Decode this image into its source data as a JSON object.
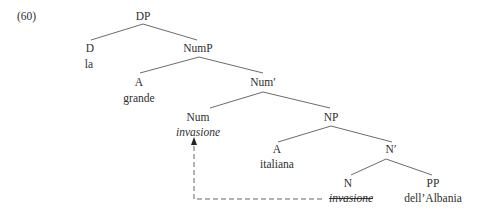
{
  "example_number": "(60)",
  "tree": {
    "nodes": [
      {
        "id": "dp",
        "label": "DP",
        "word": null,
        "x": 143,
        "y": 9
      },
      {
        "id": "d",
        "label": "D",
        "word": "la",
        "x": 90,
        "y": 41
      },
      {
        "id": "nump",
        "label": "NumP",
        "word": null,
        "x": 198,
        "y": 41
      },
      {
        "id": "a1",
        "label": "A",
        "word": "grande",
        "x": 139,
        "y": 75
      },
      {
        "id": "numbar",
        "label": "Num′",
        "word": null,
        "x": 263,
        "y": 75
      },
      {
        "id": "num",
        "label": "Num",
        "word": "invasione",
        "x": 198,
        "y": 110
      },
      {
        "id": "np",
        "label": "NP",
        "word": null,
        "x": 331,
        "y": 110
      },
      {
        "id": "a2",
        "label": "A",
        "word": "italiana",
        "x": 277,
        "y": 142
      },
      {
        "id": "nbar",
        "label": "N′",
        "word": null,
        "x": 390,
        "y": 142
      },
      {
        "id": "n",
        "label": "N",
        "word": "invasione",
        "x": 349,
        "y": 176
      },
      {
        "id": "pp",
        "label": "PP",
        "word": "dell’Albania",
        "x": 433,
        "y": 176
      }
    ],
    "labels": {
      "dp": "DP",
      "d": "D",
      "d_word": "la",
      "nump": "NumP",
      "a1": "A",
      "a1_word": "grande",
      "numbar": "Num′",
      "num": "Num",
      "num_word": "invasione",
      "np": "NP",
      "a2": "A",
      "a2_word": "italiana",
      "nbar": "N′",
      "n": "N",
      "n_word_trace": "invasione",
      "pp": "PP",
      "pp_word": "dell’Albania"
    },
    "edges": [
      {
        "from": "DP",
        "to": "D",
        "x1": 143,
        "y1": 24,
        "x2": 91,
        "y2": 40
      },
      {
        "from": "DP",
        "to": "NumP",
        "x1": 143,
        "y1": 24,
        "x2": 197,
        "y2": 40
      },
      {
        "from": "NumP",
        "to": "A",
        "x1": 199,
        "y1": 57,
        "x2": 140,
        "y2": 73
      },
      {
        "from": "NumP",
        "to": "Num'",
        "x1": 199,
        "y1": 57,
        "x2": 263,
        "y2": 73
      },
      {
        "from": "Num'",
        "to": "Num",
        "x1": 263,
        "y1": 92,
        "x2": 210,
        "y2": 108
      },
      {
        "from": "Num'",
        "to": "NP",
        "x1": 263,
        "y1": 92,
        "x2": 330,
        "y2": 108
      },
      {
        "from": "NP",
        "to": "A",
        "x1": 331,
        "y1": 126,
        "x2": 278,
        "y2": 142
      },
      {
        "from": "NP",
        "to": "N'",
        "x1": 331,
        "y1": 126,
        "x2": 392,
        "y2": 142
      },
      {
        "from": "N'",
        "to": "N",
        "x1": 386,
        "y1": 159,
        "x2": 351,
        "y2": 175
      },
      {
        "from": "N'",
        "to": "PP",
        "x1": 386,
        "y1": 159,
        "x2": 432,
        "y2": 175
      }
    ],
    "movement_arrow": {
      "from": "N (invasione, trace)",
      "to": "Num (invasione)",
      "style": "dashed",
      "path": [
        [
          322,
          199
        ],
        [
          194,
          199
        ],
        [
          194,
          141
        ]
      ]
    }
  },
  "colors": {
    "text": "#2e2e2e",
    "line": "#555555",
    "background": "#ffffff"
  }
}
